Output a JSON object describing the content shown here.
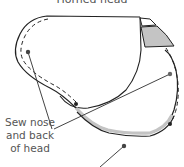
{
  "title": "Horned head",
  "annotation": {
    "lines": [
      "Sew nose",
      "and back",
      "of head"
    ]
  },
  "colors": {
    "outline": "#222222",
    "leader": "#444444",
    "fill_gray": "#c4c4c4",
    "text": "#555555",
    "background": "#ffffff"
  }
}
